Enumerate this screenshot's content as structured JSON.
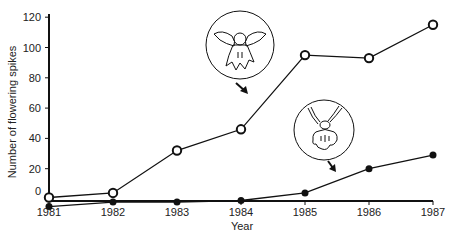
{
  "chart_data": {
    "type": "line",
    "title": "",
    "xlabel": "Year",
    "ylabel": "Number of flowering spikes",
    "x": [
      1981,
      1982,
      1983,
      1984,
      1985,
      1986,
      1987
    ],
    "x_tick_labels": [
      "1981",
      "1982",
      "1983",
      "1984",
      "1985",
      "1986",
      "1987"
    ],
    "y_tick_labels": [
      "0",
      "20",
      "40",
      "60",
      "80",
      "100",
      "120"
    ],
    "y_ticks": [
      0,
      20,
      40,
      60,
      80,
      100,
      120
    ],
    "ylim": [
      -6,
      122
    ],
    "grid": false,
    "legend": "none (series identified by flower illustrations with arrows)",
    "series": [
      {
        "name": "Orchid species A (open circles, upper flower illustration)",
        "marker": "open-circle",
        "values": [
          1,
          4,
          32,
          46,
          95,
          93,
          115
        ]
      },
      {
        "name": "Orchid species B (filled circles, lower flower illustration)",
        "marker": "filled-circle",
        "values": [
          -5,
          -2,
          -2,
          -1,
          4,
          20,
          29
        ]
      }
    ],
    "annotations": [
      {
        "type": "flower-illustration",
        "target_series": 0,
        "description": "circled orchid flower with spreading sepals, arrow pointing to open-circle line"
      },
      {
        "type": "flower-illustration",
        "target_series": 1,
        "description": "circled orchid flower with upright petals, arrow pointing to filled-circle line"
      }
    ]
  },
  "colors": {
    "line": "#111111",
    "background": "#ffffff"
  }
}
